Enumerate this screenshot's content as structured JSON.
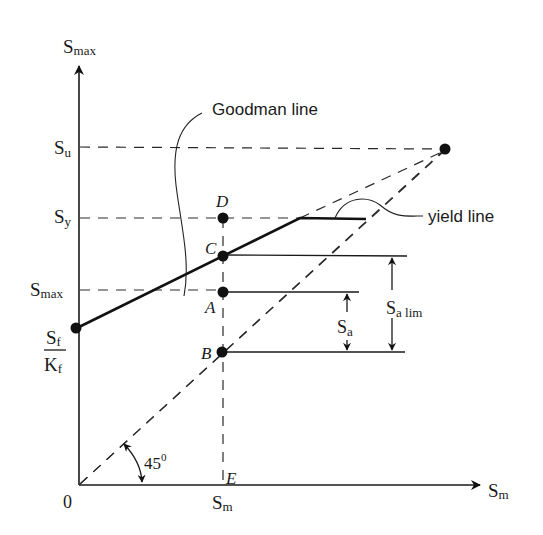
{
  "diagram": {
    "type": "modified-goodman-diagram",
    "axes": {
      "y_label_main": "S",
      "y_label_sub": "max",
      "x_label_main": "S",
      "x_label_sub": "m",
      "origin": "0"
    },
    "y_ticks": {
      "su": {
        "main": "S",
        "sub": "u"
      },
      "sy": {
        "main": "S",
        "sub": "y"
      },
      "smax": {
        "main": "S",
        "sub": "max"
      },
      "sf_num": {
        "main": "S",
        "sub": "f"
      },
      "kf_den": {
        "main": "K",
        "sub": "f"
      }
    },
    "x_ticks": {
      "sm": {
        "main": "S",
        "sub": "m"
      }
    },
    "points": {
      "A": "A",
      "B": "B",
      "C": "C",
      "D": "D",
      "E": "E"
    },
    "annotations": {
      "goodman_line": "Goodman line",
      "yield_line": "yield line",
      "angle_value": "45",
      "angle_sup": "0",
      "sa": {
        "main": "S",
        "sub": "a"
      },
      "sa_lim": {
        "main": "S",
        "sub": "a lim"
      }
    }
  }
}
